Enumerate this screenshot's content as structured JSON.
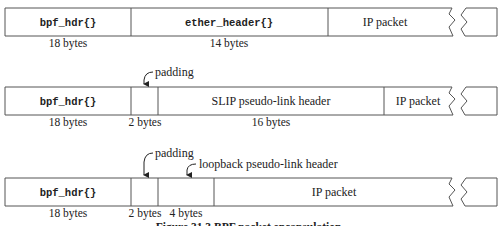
{
  "diagram": {
    "rows": [
      {
        "id": "ethernet",
        "fields": [
          {
            "label": "bpf_hdr{}",
            "mono": true,
            "size": "18 bytes"
          },
          {
            "label": "ether_header{}",
            "mono": true,
            "size": "14 bytes"
          },
          {
            "label": "IP packet",
            "mono": false,
            "size": ""
          }
        ],
        "annotations": []
      },
      {
        "id": "slip",
        "fields": [
          {
            "label": "bpf_hdr{}",
            "mono": true,
            "size": "18 bytes"
          },
          {
            "label": "",
            "mono": false,
            "size": "2 bytes"
          },
          {
            "label": "SLIP pseudo-link header",
            "mono": false,
            "size": "16 bytes"
          },
          {
            "label": "IP packet",
            "mono": false,
            "size": ""
          }
        ],
        "annotations": [
          {
            "label": "padding",
            "points_to": "2 bytes"
          }
        ]
      },
      {
        "id": "loopback",
        "fields": [
          {
            "label": "bpf_hdr{}",
            "mono": true,
            "size": "18 bytes"
          },
          {
            "label": "",
            "mono": false,
            "size": "2 bytes"
          },
          {
            "label": "",
            "mono": false,
            "size": "4 bytes"
          },
          {
            "label": "IP packet",
            "mono": false,
            "size": ""
          }
        ],
        "annotations": [
          {
            "label": "padding",
            "points_to": "2 bytes"
          },
          {
            "label": "loopback pseudo-link header",
            "points_to": "4 bytes"
          }
        ]
      }
    ],
    "caption": "Figure 31.3  BPF packet encapsulation."
  },
  "colors": {
    "line": "#555555",
    "text": "#222222",
    "background": "#ffffff"
  }
}
